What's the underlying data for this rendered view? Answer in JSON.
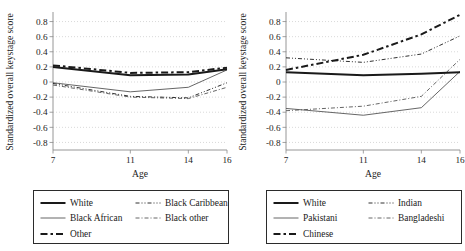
{
  "chart_data": [
    {
      "type": "line",
      "title": "",
      "xlabel": "Age",
      "ylabel": "Standardized overall keystage score",
      "x": [
        7,
        11,
        14,
        16
      ],
      "xticklabels": [
        "7",
        "11",
        "14",
        "16"
      ],
      "yticklabels": [
        "0.8",
        "0.6",
        "0.4",
        "0.2",
        "0",
        "-0.2",
        "-0.4",
        "-0.6",
        "-0.8"
      ],
      "yticks": [
        0.8,
        0.6,
        0.4,
        0.2,
        0,
        -0.2,
        -0.4,
        -0.6,
        -0.8
      ],
      "ylim": [
        -0.9,
        0.9
      ],
      "xlim": [
        7,
        16
      ],
      "grid": true,
      "legend_position": "below",
      "series": [
        {
          "name": "White",
          "style": "solid-thick",
          "values": [
            0.2,
            0.09,
            0.1,
            0.17
          ]
        },
        {
          "name": "Black African",
          "style": "solid-thin",
          "values": [
            -0.01,
            -0.13,
            -0.07,
            0.16
          ]
        },
        {
          "name": "Other",
          "style": "dash-dot",
          "values": [
            0.22,
            0.12,
            0.13,
            0.19
          ]
        },
        {
          "name": "Black Caribbean",
          "style": "dash-dot-dot",
          "values": [
            -0.02,
            -0.19,
            -0.21,
            -0.01
          ]
        },
        {
          "name": "Black other",
          "style": "dash-dot-thin",
          "values": [
            -0.04,
            -0.2,
            -0.22,
            -0.07
          ]
        }
      ]
    },
    {
      "type": "line",
      "title": "",
      "xlabel": "Age",
      "ylabel": "Standardized overall keystage score",
      "x": [
        7,
        11,
        14,
        16
      ],
      "xticklabels": [
        "7",
        "11",
        "14",
        "16"
      ],
      "yticklabels": [
        "0.8",
        "0.6",
        "0.4",
        "0.2",
        "0",
        "-0.2",
        "-0.4",
        "-0.6",
        "-0.8"
      ],
      "yticks": [
        0.8,
        0.6,
        0.4,
        0.2,
        0,
        -0.2,
        -0.4,
        -0.6,
        -0.8
      ],
      "ylim": [
        -0.9,
        0.9
      ],
      "xlim": [
        7,
        16
      ],
      "grid": true,
      "legend_position": "below",
      "series": [
        {
          "name": "White",
          "style": "solid-thick",
          "values": [
            0.13,
            0.09,
            0.11,
            0.13
          ]
        },
        {
          "name": "Pakistani",
          "style": "solid-thin",
          "values": [
            -0.35,
            -0.44,
            -0.34,
            0.14
          ]
        },
        {
          "name": "Chinese",
          "style": "dash-dot",
          "values": [
            0.16,
            0.36,
            0.63,
            0.89
          ]
        },
        {
          "name": "Indian",
          "style": "dash-dot-dot",
          "values": [
            0.32,
            0.26,
            0.37,
            0.61
          ]
        },
        {
          "name": "Bangladeshi",
          "style": "dash-dot-thin",
          "values": [
            -0.38,
            -0.32,
            -0.19,
            0.3
          ]
        }
      ]
    }
  ],
  "panels": [
    {
      "axis": {
        "ylabel": "Standardized overall keystage score",
        "xlabel": "Age",
        "yticks": [
          "0.8",
          "0.6",
          "0.4",
          "0.2",
          "0",
          "-0.2",
          "-0.4",
          "-0.6",
          "-0.8"
        ],
        "xticks": [
          "7",
          "11",
          "14",
          "16"
        ]
      },
      "legend": [
        {
          "label": "White",
          "style": "solid-thick"
        },
        {
          "label": "Black Caribbean",
          "style": "dash-dot-dot"
        },
        {
          "label": "Black African",
          "style": "solid-thin"
        },
        {
          "label": "Black other",
          "style": "dash-dot-thin"
        },
        {
          "label": "Other",
          "style": "dash-dot"
        }
      ]
    },
    {
      "axis": {
        "ylabel": "Standardized overall keystage score",
        "xlabel": "Age",
        "yticks": [
          "0.8",
          "0.6",
          "0.4",
          "0.2",
          "0",
          "-0.2",
          "-0.4",
          "-0.6",
          "-0.8"
        ],
        "xticks": [
          "7",
          "11",
          "14",
          "16"
        ]
      },
      "legend": [
        {
          "label": "White",
          "style": "solid-thick"
        },
        {
          "label": "Indian",
          "style": "dash-dot-dot"
        },
        {
          "label": "Pakistani",
          "style": "solid-thin"
        },
        {
          "label": "Bangladeshi",
          "style": "dash-dot-thin"
        },
        {
          "label": "Chinese",
          "style": "dash-dot"
        }
      ]
    }
  ],
  "colors": {
    "line": "#1a1a1a",
    "thin_line": "#555555",
    "grid": "#c9c9c9",
    "axis": "#8a8a8a",
    "background": "#ffffff"
  }
}
